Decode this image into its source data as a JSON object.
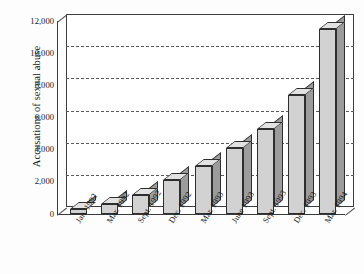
{
  "chart_data": {
    "type": "bar",
    "title": "",
    "subtitle": "",
    "xlabel": "",
    "ylabel": "Accusations of sexual abuse",
    "categories": [
      "Jan. 1992",
      "Mar. 1992",
      "Sept. 1992",
      "Dec. 1992",
      "Mar. 1993",
      "June 1993",
      "Sept. 1993",
      "Dec. 1993",
      "Mar. 1994"
    ],
    "values": [
      300,
      600,
      1200,
      2100,
      3000,
      4100,
      5300,
      7400,
      11500
    ],
    "ylim": [
      0,
      12000
    ],
    "ytick_labels": [
      "0",
      "2,000",
      "4,000",
      "6,000",
      "8,000",
      "10,000",
      "12,000"
    ],
    "ytick_values": [
      0,
      2000,
      4000,
      6000,
      8000,
      10000,
      12000
    ],
    "grid": true,
    "grid_style": "dashed-horizontal",
    "legend": null,
    "legend_position": "none",
    "style": "3d-bar",
    "colors": {
      "bar_front": "#d2d2d2",
      "bar_side": "#9c9c9c",
      "bar_top": "#e2e2e2",
      "bar_outline": "#2e2e2e",
      "axis": "#3a3a3a",
      "grid": "#585858",
      "background": "#fdfdfd",
      "text": "#171717"
    }
  }
}
